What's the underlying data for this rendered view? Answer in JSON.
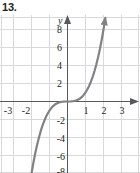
{
  "figure": {
    "problem_number": "13.",
    "axis_label_y": "y",
    "colors": {
      "grid": "#d8d8dc",
      "axis": "#58585b",
      "curve": "#808285",
      "text": "#231f20"
    }
  },
  "chart_data": {
    "type": "line",
    "title": "",
    "subtitle": "",
    "xlabel": "",
    "ylabel": "y",
    "function": "y = x^3",
    "xlim": [
      -3.7,
      3.9
    ],
    "ylim": [
      -9.5,
      9.8
    ],
    "grid": true,
    "grid_spacing_x": 1,
    "grid_spacing_y": 2,
    "legend": "none",
    "x_tick_labels": [
      "-3",
      "-2",
      "1",
      "2",
      "3"
    ],
    "x_tick_values": [
      -3,
      -2,
      1,
      2,
      3
    ],
    "y_tick_labels": [
      "8",
      "6",
      "4",
      "2",
      "-2",
      "-4",
      "-6",
      "-8"
    ],
    "y_tick_values": [
      8,
      6,
      4,
      2,
      -2,
      -4,
      -6,
      -8
    ],
    "series": [
      {
        "name": "y = x^3",
        "x": [
          -2.1,
          -2.0,
          -1.9,
          -1.8,
          -1.7,
          -1.6,
          -1.5,
          -1.4,
          -1.3,
          -1.2,
          -1.1,
          -1.0,
          -0.9,
          -0.8,
          -0.7,
          -0.6,
          -0.5,
          -0.4,
          -0.3,
          -0.2,
          -0.1,
          0.0,
          0.1,
          0.2,
          0.3,
          0.4,
          0.5,
          0.6,
          0.7,
          0.8,
          0.9,
          1.0,
          1.1,
          1.2,
          1.3,
          1.4,
          1.5,
          1.6,
          1.7,
          1.8,
          1.9,
          2.0,
          2.1
        ],
        "y": [
          -9.26,
          -8.0,
          -6.86,
          -5.83,
          -4.91,
          -4.1,
          -3.38,
          -2.74,
          -2.2,
          -1.73,
          -1.33,
          -1.0,
          -0.73,
          -0.51,
          -0.34,
          -0.22,
          -0.13,
          -0.06,
          -0.03,
          -0.01,
          0.0,
          0.0,
          0.0,
          0.01,
          0.03,
          0.06,
          0.13,
          0.22,
          0.34,
          0.51,
          0.73,
          1.0,
          1.33,
          1.73,
          2.2,
          2.74,
          3.38,
          4.1,
          4.91,
          5.83,
          6.86,
          8.0,
          9.26
        ]
      }
    ],
    "annotations": [
      {
        "name": "arrowhead-top",
        "at_x": 2.1,
        "at_y": 9.26
      },
      {
        "name": "x-axis-arrow-right",
        "at_x": 3.9,
        "at_y": 0
      },
      {
        "name": "y-axis-arrow-top",
        "at_x": 0,
        "at_y": 9.8
      }
    ]
  }
}
